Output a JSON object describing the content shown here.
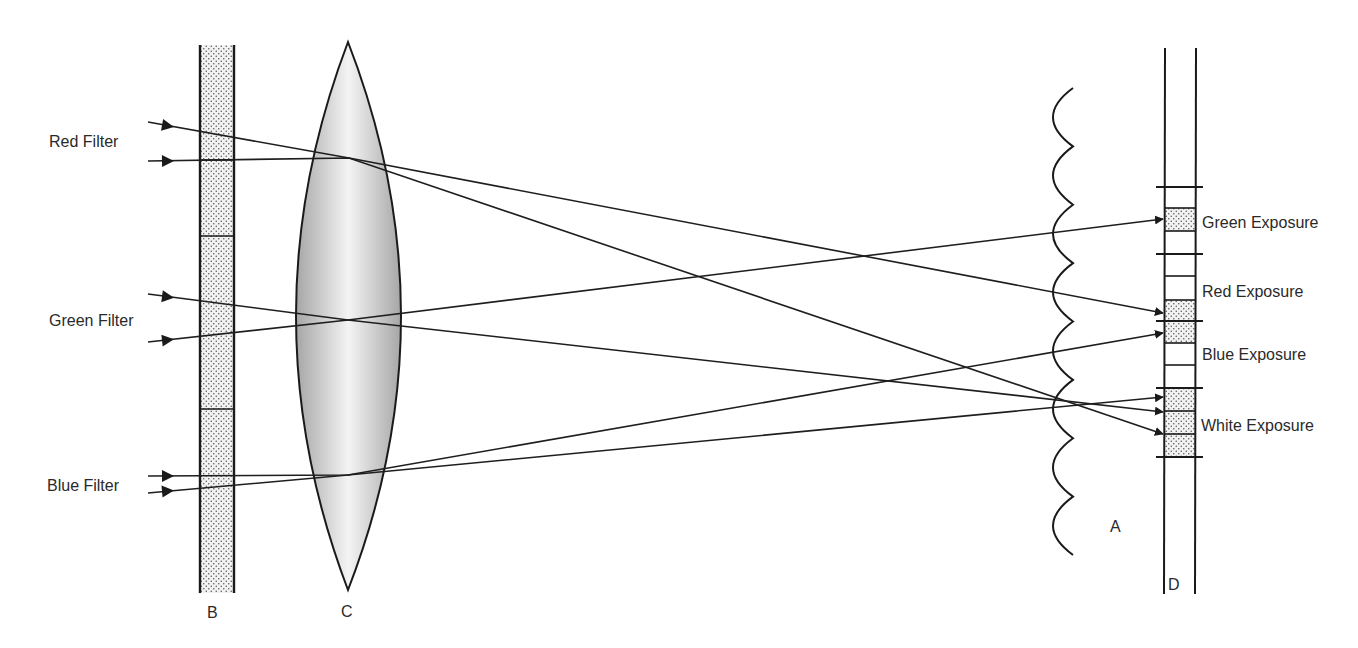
{
  "colors": {
    "line": "#1a1a1a",
    "text": "#2a2a2a",
    "lens_edge": "#a6a6a6",
    "lens_center": "#f4f4f4",
    "stipple_bg": "#f2f2f2",
    "stipple_dot": "#555555"
  },
  "labels": {
    "filters": [
      {
        "id": "red",
        "text": "Red Filter",
        "x": 49,
        "y": 147
      },
      {
        "id": "green",
        "text": "Green Filter",
        "x": 49,
        "y": 326
      },
      {
        "id": "blue",
        "text": "Blue Filter",
        "x": 47,
        "y": 491
      }
    ],
    "exposures": [
      {
        "id": "green",
        "text": "Green Exposure",
        "x": 1202,
        "y": 228
      },
      {
        "id": "red",
        "text": "Red Exposure",
        "x": 1202,
        "y": 297
      },
      {
        "id": "blue",
        "text": "Blue Exposure",
        "x": 1202,
        "y": 360
      },
      {
        "id": "white",
        "text": "White Exposure",
        "x": 1201,
        "y": 431
      }
    ],
    "parts": [
      {
        "id": "B",
        "text": "B",
        "x": 207,
        "y": 618,
        "meaning": "tricolor filter band"
      },
      {
        "id": "C",
        "text": "C",
        "x": 341,
        "y": 617,
        "meaning": "camera lens"
      },
      {
        "id": "A",
        "text": "A",
        "x": 1110,
        "y": 532,
        "meaning": "lenticular screen"
      },
      {
        "id": "D",
        "text": "D",
        "x": 1168,
        "y": 590,
        "meaning": "film emulsion strip"
      }
    ]
  },
  "filter_band": {
    "x": 200,
    "width": 34,
    "top": 45,
    "bottom": 593,
    "dividers": [
      160,
      236,
      409
    ]
  },
  "lens": {
    "cx": 348,
    "top": 42,
    "bottom": 590,
    "left": 296,
    "right": 402
  },
  "lenticular_screen": {
    "x_cusp": 1073,
    "x_trough": 1053,
    "top": 88,
    "bottom": 555,
    "segments": 8
  },
  "film_strip": {
    "left": 1165,
    "right": 1196,
    "top": 48,
    "bottom": 594,
    "ticks": [
      187,
      254,
      321,
      388,
      457
    ],
    "cells": [
      {
        "y": 208,
        "h": 23,
        "stipple": true
      },
      {
        "y": 231,
        "h": 23,
        "stipple": false
      },
      {
        "y": 254,
        "h": 22,
        "stipple": false
      },
      {
        "y": 276,
        "h": 24,
        "stipple": false
      },
      {
        "y": 300,
        "h": 21,
        "stipple": true
      },
      {
        "y": 321,
        "h": 22,
        "stipple": true
      },
      {
        "y": 343,
        "h": 22,
        "stipple": false
      },
      {
        "y": 365,
        "h": 23,
        "stipple": false
      },
      {
        "y": 388,
        "h": 23,
        "stipple": true
      },
      {
        "y": 411,
        "h": 23,
        "stipple": true
      },
      {
        "y": 434,
        "h": 23,
        "stipple": true
      }
    ]
  },
  "rays": [
    {
      "id": "red-top",
      "points": [
        [
          148,
          122
        ],
        [
          349,
          158
        ],
        [
          1163,
          313
        ]
      ],
      "arrow_start": [
        168,
        126
      ]
    },
    {
      "id": "red-bottom",
      "points": [
        [
          148,
          161
        ],
        [
          349,
          158
        ],
        [
          1163,
          434
        ]
      ],
      "arrow_start": [
        168,
        161
      ]
    },
    {
      "id": "green-top",
      "points": [
        [
          148,
          294
        ],
        [
          348,
          320
        ],
        [
          1163,
          412
        ]
      ],
      "arrow_start": [
        168,
        297
      ]
    },
    {
      "id": "green-bottom",
      "points": [
        [
          148,
          342
        ],
        [
          348,
          320
        ],
        [
          1163,
          219
        ]
      ],
      "arrow_start": [
        168,
        340
      ]
    },
    {
      "id": "blue-top",
      "points": [
        [
          148,
          476
        ],
        [
          348,
          475
        ],
        [
          1163,
          333
        ]
      ],
      "arrow_start": [
        168,
        476
      ]
    },
    {
      "id": "blue-bottom",
      "points": [
        [
          148,
          493
        ],
        [
          348,
          475
        ],
        [
          1163,
          397
        ]
      ],
      "arrow_start": [
        168,
        491
      ]
    }
  ]
}
